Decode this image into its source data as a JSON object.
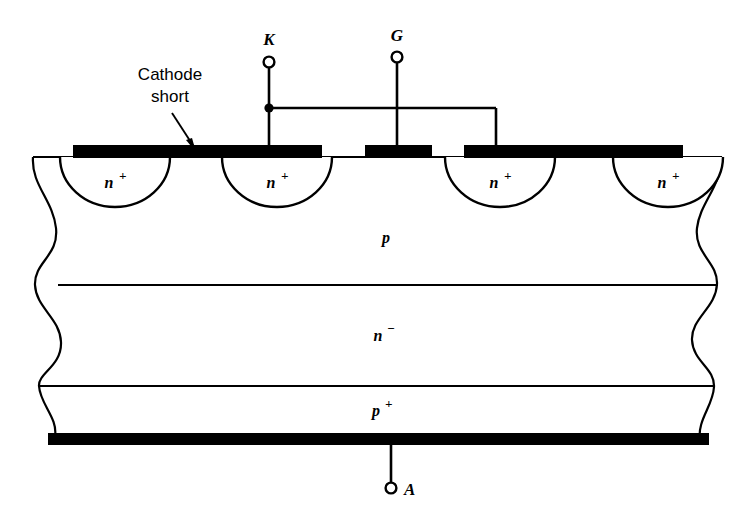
{
  "figure": {
    "background_color": "#ffffff",
    "line_color": "#000000",
    "metal_color": "#000000"
  },
  "terminals": [
    {
      "id": "cathode",
      "label": "K",
      "name": "cathode-terminal"
    },
    {
      "id": "gate",
      "label": "G",
      "name": "gate-terminal"
    },
    {
      "id": "anode",
      "label": "A",
      "name": "anode-terminal"
    }
  ],
  "annotations": [
    {
      "id": "cathode-short",
      "line1": "Cathode",
      "line2": "short"
    }
  ],
  "regions": [
    {
      "id": "p-base",
      "label": "p",
      "sup": ""
    },
    {
      "id": "n-drift",
      "label": "n",
      "sup": "−"
    },
    {
      "id": "p-emitter",
      "label": "p",
      "sup": "+"
    }
  ],
  "wells": [
    {
      "id": "well-1",
      "label": "n",
      "sup": "+"
    },
    {
      "id": "well-2",
      "label": "n",
      "sup": "+"
    },
    {
      "id": "well-3",
      "label": "n",
      "sup": "+"
    },
    {
      "id": "well-4",
      "label": "n",
      "sup": "+"
    }
  ],
  "metal_contacts": [
    {
      "id": "metal-cathode-left",
      "connected_to": "K"
    },
    {
      "id": "metal-gate",
      "connected_to": "G"
    },
    {
      "id": "metal-cathode-right",
      "connected_to": "K"
    },
    {
      "id": "metal-anode",
      "connected_to": "A"
    }
  ]
}
